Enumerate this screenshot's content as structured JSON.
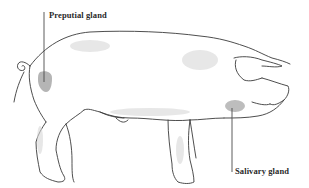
{
  "figure": {
    "labels": [
      {
        "id": "preputial",
        "text": "Preputial gland"
      },
      {
        "id": "salivary",
        "text": "Salivary gland"
      }
    ],
    "colors": {
      "outline": "#3a3a3a",
      "gland_highlight": "#b5b5b5",
      "shading": "#d8d8d8",
      "background": "#ffffff",
      "leader_line": "#4a4a4a"
    }
  }
}
